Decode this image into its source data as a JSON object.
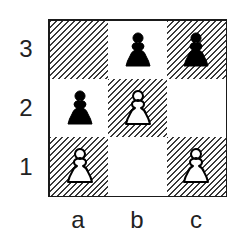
{
  "diagram": {
    "type": "chess-board-fragment",
    "files": [
      "a",
      "b",
      "c"
    ],
    "ranks": [
      "3",
      "2",
      "1"
    ],
    "colors": {
      "dark_hatch": "#3a3a3a",
      "light": "#ffffff",
      "border": "#1a1a1a",
      "black_piece": "#000000",
      "white_piece": "#ffffff"
    },
    "squares": [
      {
        "id": "a3",
        "shade": "dark",
        "piece": null
      },
      {
        "id": "b3",
        "shade": "light",
        "piece": "black-pawn"
      },
      {
        "id": "c3",
        "shade": "dark",
        "piece": "black-pawn"
      },
      {
        "id": "a2",
        "shade": "light",
        "piece": "black-pawn"
      },
      {
        "id": "b2",
        "shade": "dark",
        "piece": "white-pawn"
      },
      {
        "id": "c2",
        "shade": "light",
        "piece": null
      },
      {
        "id": "a1",
        "shade": "dark",
        "piece": "white-pawn"
      },
      {
        "id": "b1",
        "shade": "light",
        "piece": null
      },
      {
        "id": "c1",
        "shade": "dark",
        "piece": "white-pawn"
      }
    ]
  }
}
